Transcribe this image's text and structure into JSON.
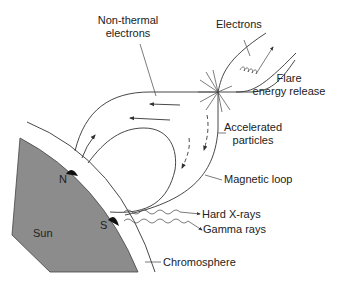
{
  "diagram": {
    "colors": {
      "sun_fill": "#8c8c8c",
      "line": "#333333",
      "text": "#222222",
      "footpoint": "#111111",
      "background": "#ffffff"
    },
    "labels": {
      "non_thermal_electrons": [
        "Non-thermal",
        "electrons"
      ],
      "electrons": "Electrons",
      "flare_energy_release": [
        "Flare",
        "energy release"
      ],
      "accelerated_particles": [
        "Accelerated",
        "particles"
      ],
      "magnetic_loop": "Magnetic loop",
      "hard_xrays": "Hard X-rays",
      "gamma_rays": "Gamma rays",
      "chromosphere": "Chromosphere",
      "sun": "Sun",
      "north_pole": "N",
      "south_pole": "S"
    },
    "icons": {
      "flare_burst": "starburst-icon",
      "electron_spiral": "spiral-icon",
      "direction_arrow": "arrow-icon",
      "radiation_wave": "wavy-arrow-icon"
    }
  }
}
